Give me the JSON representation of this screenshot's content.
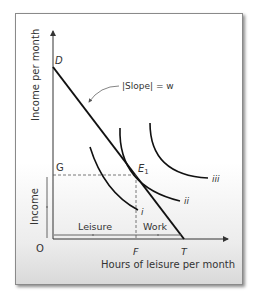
{
  "diagram": {
    "type": "labor-leisure-choice",
    "axes": {
      "y_label": "Income per month",
      "x_label": "Hours of leisure per month",
      "origin_label": "O"
    },
    "points": {
      "D": "D",
      "E1": "E",
      "E1_sub": "1",
      "G": "G",
      "F": "F",
      "T": "T"
    },
    "annotation": {
      "slope_label": "|Slope| = w"
    },
    "brackets": {
      "income_label": "Income",
      "leisure_label": "Leisure",
      "work_label": "Work"
    },
    "indifference_curves": [
      {
        "label": "i"
      },
      {
        "label": "ii"
      },
      {
        "label": "iii"
      }
    ],
    "colors": {
      "line": "#111111",
      "axis": "#333333",
      "dashed": "#555555",
      "text": "#333333"
    }
  }
}
